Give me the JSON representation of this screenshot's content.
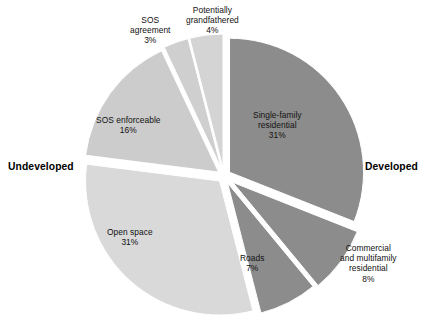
{
  "chart_data": {
    "type": "pie",
    "title": "",
    "subtitle": "",
    "xlabel": "",
    "ylabel": "",
    "legend_position": "none",
    "grid": false,
    "units": "percent",
    "total": 100,
    "categories": [
      "Single-family residential",
      "Commercial and multifamily residential",
      "Roads",
      "Open space",
      "SOS enforceable",
      "SOS agreement",
      "Potentially grandfathered"
    ],
    "values": [
      31,
      8,
      7,
      31,
      16,
      3,
      4
    ],
    "slices": [
      {
        "name": "Single-family residential",
        "label_lines": [
          "Single-family",
          "residential",
          "31%"
        ],
        "value": 31,
        "value_label": "31%",
        "color": "#8c8c8c",
        "group": "Developed",
        "start_angle": 0,
        "end_angle": 111.6,
        "explode": 0.05,
        "label_x": 253,
        "label_y": 110
      },
      {
        "name": "Commercial and multifamily residential",
        "label_lines": [
          "Commercial",
          "and multifamily",
          "residential",
          "8%"
        ],
        "value": 8,
        "value_label": "8%",
        "color": "#8c8c8c",
        "group": "Developed",
        "start_angle": 111.6,
        "end_angle": 140.4,
        "explode": 0.08,
        "label_x": 340,
        "label_y": 243
      },
      {
        "name": "Roads",
        "label_lines": [
          "Roads",
          "7%"
        ],
        "value": 7,
        "value_label": "7%",
        "color": "#8c8c8c",
        "group": "Developed",
        "start_angle": 140.4,
        "end_angle": 165.6,
        "explode": 0.06,
        "label_x": 240,
        "label_y": 253
      },
      {
        "name": "Open space",
        "label_lines": [
          "Open space",
          "31%"
        ],
        "value": 31,
        "value_label": "31%",
        "color": "#d9d9d9",
        "group": "Undeveloped",
        "start_angle": 165.6,
        "end_angle": 277.2,
        "explode": 0.05,
        "label_x": 107,
        "label_y": 227
      },
      {
        "name": "SOS enforceable",
        "label_lines": [
          "SOS enforceable",
          "16%"
        ],
        "value": 16,
        "value_label": "16%",
        "color": "#cccccc",
        "group": "Undeveloped",
        "start_angle": 277.2,
        "end_angle": 334.8,
        "explode": 0.05,
        "label_x": 96,
        "label_y": 115
      },
      {
        "name": "SOS agreement",
        "label_lines": [
          "SOS",
          "agreement",
          "3%"
        ],
        "value": 3,
        "value_label": "3%",
        "color": "#cfcfcf",
        "group": "Undeveloped",
        "start_angle": 334.8,
        "end_angle": 345.6,
        "explode": 0.06,
        "label_x": 130,
        "label_y": 15
      },
      {
        "name": "Potentially grandfathered",
        "label_lines": [
          "Potentially",
          "grandfathered",
          "4%"
        ],
        "value": 4,
        "value_label": "4%",
        "color": "#d4d4d4",
        "group": "Undeveloped",
        "start_angle": 345.6,
        "end_angle": 360,
        "explode": 0.06,
        "label_x": 186,
        "label_y": 5
      }
    ],
    "annotations": [
      {
        "text": "Undeveloped",
        "x": 8,
        "y": 161
      },
      {
        "text": "Developed",
        "x": 365,
        "y": 161
      }
    ],
    "geometry": {
      "center_x": 224,
      "center_y": 176,
      "radius": 134
    },
    "colors": {
      "developed": "#8c8c8c",
      "undeveloped_light": "#d9d9d9",
      "undeveloped_mid": "#cccccc",
      "background": "#ffffff",
      "text": "#111111"
    }
  }
}
